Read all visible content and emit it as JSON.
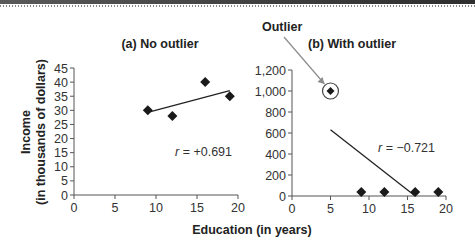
{
  "chart_data": [
    {
      "type": "scatter",
      "title": "(a) No outlier",
      "xlabel": "Education (in years)",
      "ylabel": "Income (in thousands of dollars)",
      "xlim": [
        0,
        20
      ],
      "ylim": [
        0,
        45
      ],
      "xticks": [
        0,
        5,
        10,
        15,
        20
      ],
      "yticks": [
        0,
        5,
        10,
        15,
        20,
        25,
        30,
        35,
        40,
        45
      ],
      "xtick_labels": [
        "0",
        "5",
        "10",
        "15",
        "20"
      ],
      "ytick_labels": [
        "0",
        "5",
        "10",
        "15",
        "20",
        "25",
        "30",
        "35",
        "40",
        "45"
      ],
      "points": [
        {
          "x": 9,
          "y": 30
        },
        {
          "x": 12,
          "y": 28
        },
        {
          "x": 16,
          "y": 40
        },
        {
          "x": 19,
          "y": 35
        }
      ],
      "regression_line": {
        "x": [
          9,
          19
        ],
        "y": [
          29.3,
          37
        ]
      },
      "annotation": {
        "r_symbol": "r",
        "r_text": " = +0.691"
      },
      "grid": false
    },
    {
      "type": "scatter",
      "title": "(b) With outlier",
      "xlabel": "Education (in years)",
      "ylabel": "Income (in thousands of dollars)",
      "xlim": [
        0,
        20
      ],
      "ylim": [
        0,
        1200
      ],
      "xticks": [
        0,
        5,
        10,
        15,
        20
      ],
      "yticks": [
        0,
        200,
        400,
        600,
        800,
        1000,
        1200
      ],
      "xtick_labels": [
        "0",
        "5",
        "10",
        "15",
        "20"
      ],
      "ytick_labels": [
        "0",
        "200",
        "400",
        "600",
        "800",
        "1,000",
        "1,200"
      ],
      "points": [
        {
          "x": 5,
          "y": 1000,
          "outlier": true
        },
        {
          "x": 9,
          "y": 30
        },
        {
          "x": 12,
          "y": 30
        },
        {
          "x": 16,
          "y": 30
        },
        {
          "x": 19,
          "y": 30
        }
      ],
      "regression_line": {
        "x": [
          5,
          16
        ],
        "y": [
          630,
          0
        ]
      },
      "annotation": {
        "r_symbol": "r",
        "r_text": " = −0.721"
      },
      "outlier_label": "Outlier",
      "grid": false
    }
  ],
  "shared": {
    "xlabel": "Education (in years)",
    "ylabel_line1": "Income",
    "ylabel_line2": "(in thousands of dollars)"
  },
  "colors": {
    "marker": "#1a1a1a",
    "line": "#222222",
    "axis": "#555555",
    "arrow": "#8c8c8c"
  }
}
